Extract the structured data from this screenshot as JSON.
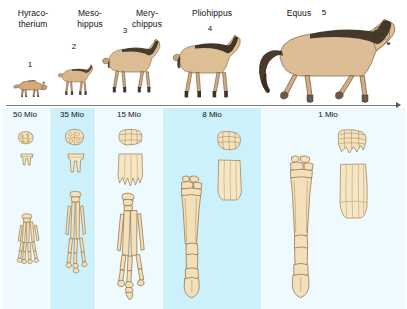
{
  "figure": {
    "background": "#ffffff",
    "band_shade_color": "#cdf1fa",
    "band_faint_color": "#eefafd",
    "bone_fill": "#f6e3c0",
    "bone_outline": "#8a6a3c",
    "tooth_fill": "#f7e8c8",
    "axis_color": "#7d7d7d"
  },
  "columns": [
    {
      "id": "hyracotherium",
      "genus_lines": [
        "Hyraco-",
        "therium"
      ],
      "number": "1",
      "age": "50 Mio",
      "band": "faint",
      "band_left": 2,
      "band_width": 46,
      "header_left": 2,
      "header_width": 62,
      "age_center": 25
    },
    {
      "id": "mesohippus",
      "genus_lines": [
        "Meso-",
        "hippus"
      ],
      "number": "2",
      "age": "35 Mio",
      "band": "shade",
      "band_left": 50,
      "band_width": 45,
      "header_left": 64,
      "header_width": 52,
      "age_center": 72
    },
    {
      "id": "merychippus",
      "genus_lines": [
        "Mery-",
        "chippus"
      ],
      "number": "3",
      "age": "15 Mio",
      "band": "faint",
      "band_left": 96,
      "band_width": 66,
      "header_left": 118,
      "header_width": 58,
      "age_center": 129
    },
    {
      "id": "pliohippus",
      "genus_lines": [
        "Pliohippus"
      ],
      "number": "4",
      "age": "8 Mio",
      "band": "shade",
      "band_left": 163,
      "band_width": 98,
      "header_left": 174,
      "header_width": 76,
      "age_center": 212
    },
    {
      "id": "equus",
      "genus_lines": [
        "Equus"
      ],
      "number": "5",
      "age": "1 Mio",
      "band": "faint",
      "band_left": 262,
      "band_width": 143,
      "header_left": 274,
      "header_width": 50,
      "age_center": 328
    }
  ],
  "axis": {
    "label": "time axis, oldest to youngest, left to right",
    "arrow_direction": "right"
  }
}
